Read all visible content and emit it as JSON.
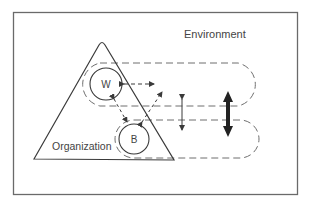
{
  "diagram": {
    "environment_label": "Environment",
    "organization_label": "Organization",
    "nodes": [
      {
        "id": "W",
        "label": "W"
      },
      {
        "id": "B",
        "label": "B"
      }
    ],
    "colors": {
      "line": "#3a3a3a",
      "frame": "#6a6a6a",
      "dash": "#6e6e6e",
      "background": "#ffffff"
    }
  }
}
